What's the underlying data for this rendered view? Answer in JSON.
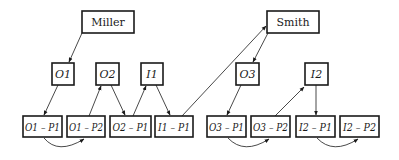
{
  "diagram": {
    "people": [
      {
        "id": "miller",
        "label": "Miller",
        "x": 82,
        "y": 11,
        "w": 52,
        "h": 22
      },
      {
        "id": "smith",
        "label": "Smith",
        "x": 267,
        "y": 11,
        "w": 52,
        "h": 22
      }
    ],
    "objects": [
      {
        "id": "O1",
        "label": "O1",
        "x": 52,
        "y": 63,
        "w": 22,
        "h": 22
      },
      {
        "id": "O2",
        "label": "O2",
        "x": 96,
        "y": 63,
        "w": 23,
        "h": 22
      },
      {
        "id": "I1",
        "label": "I1",
        "x": 141,
        "y": 63,
        "w": 22,
        "h": 22
      },
      {
        "id": "O3",
        "label": "O3",
        "x": 236,
        "y": 63,
        "w": 23,
        "h": 22
      },
      {
        "id": "I2",
        "label": "I2",
        "x": 305,
        "y": 63,
        "w": 23,
        "h": 22
      }
    ],
    "parts": [
      {
        "id": "O1-P1",
        "label": "O1 – P1",
        "x": 23,
        "y": 116,
        "w": 39,
        "h": 21
      },
      {
        "id": "O1-P2",
        "label": "O1 – P2",
        "x": 67,
        "y": 116,
        "w": 38,
        "h": 21
      },
      {
        "id": "O2-P1",
        "label": "O2 – P1",
        "x": 110,
        "y": 116,
        "w": 41,
        "h": 21
      },
      {
        "id": "I1-P1",
        "label": "I1 – P1",
        "x": 155,
        "y": 116,
        "w": 38,
        "h": 21
      },
      {
        "id": "O3-P1",
        "label": "O3 – P1",
        "x": 207,
        "y": 116,
        "w": 39,
        "h": 21
      },
      {
        "id": "O3-P2",
        "label": "O3 – P2",
        "x": 251,
        "y": 116,
        "w": 39,
        "h": 21
      },
      {
        "id": "I2-P1",
        "label": "I2 – P1",
        "x": 296,
        "y": 116,
        "w": 39,
        "h": 21
      },
      {
        "id": "I2-P2",
        "label": "I2 – P2",
        "x": 340,
        "y": 116,
        "w": 39,
        "h": 21
      }
    ],
    "edges": [
      {
        "from": "Miller",
        "to": "O1"
      },
      {
        "from": "O1",
        "to": "O1-P1"
      },
      {
        "from": "O1-P2",
        "to": "O2"
      },
      {
        "from": "O2",
        "to": "O2-P1"
      },
      {
        "from": "O2-P1",
        "to": "I1"
      },
      {
        "from": "I1",
        "to": "I1-P1"
      },
      {
        "from": "I1-P1",
        "to": "Smith"
      },
      {
        "from": "Smith",
        "to": "O3"
      },
      {
        "from": "O3",
        "to": "O3-P1"
      },
      {
        "from": "O3-P2",
        "to": "I2"
      },
      {
        "from": "I2",
        "to": "I2-P1"
      },
      {
        "from": "O1-P1",
        "to": "O1-P2",
        "curved": true
      },
      {
        "from": "O3-P1",
        "to": "O3-P2",
        "curved": true
      },
      {
        "from": "I2-P1",
        "to": "I2-P2",
        "curved": true
      }
    ]
  }
}
